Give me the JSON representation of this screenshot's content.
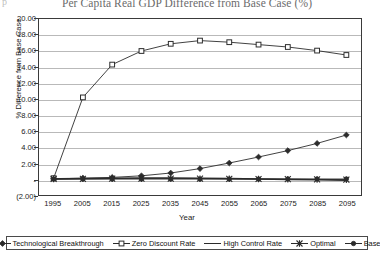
{
  "chart_data": {
    "type": "line",
    "title": "Per Capita Real GDP Difference from Base Case (%)",
    "xlabel": "Year",
    "ylabel": "% Difference from Base Case",
    "grid": true,
    "legend_position": "bottom",
    "ylim": [
      -2.0,
      20.0
    ],
    "ytick_step": 2.0,
    "ytick_labels": [
      "20.00",
      "18.00",
      "16.00",
      "14.00",
      "12.00",
      "10.00",
      "8.00",
      "6.00",
      "4.00",
      "2.00",
      "-",
      "(2.00)"
    ],
    "ytick_values": [
      20.0,
      18.0,
      16.0,
      14.0,
      12.0,
      10.0,
      8.0,
      6.0,
      4.0,
      2.0,
      0.0,
      -2.0
    ],
    "categories": [
      "1995",
      "2005",
      "2015",
      "2025",
      "2035",
      "2045",
      "2055",
      "2065",
      "2075",
      "2085",
      "2095"
    ],
    "x": [
      1995,
      2005,
      2015,
      2025,
      2035,
      2045,
      2055,
      2065,
      2075,
      2085,
      2095
    ],
    "series": [
      {
        "name": "Technological Breakthrough",
        "marker": "diamond",
        "color": "#2b2b2b",
        "values": [
          0.05,
          0.1,
          0.2,
          0.4,
          0.75,
          1.3,
          2.0,
          2.75,
          3.55,
          4.45,
          5.5
        ]
      },
      {
        "name": "Zero Discount Rate",
        "marker": "square",
        "color": "#2b2b2b",
        "values": [
          0.1,
          10.2,
          14.3,
          16.0,
          16.9,
          17.3,
          17.1,
          16.8,
          16.5,
          16.05,
          15.5
        ]
      },
      {
        "name": "High Control Rate",
        "marker": "none",
        "color": "#2b2b2b",
        "values": [
          0.0,
          0.05,
          0.1,
          0.12,
          0.12,
          0.1,
          0.05,
          0.0,
          -0.05,
          -0.1,
          -0.15
        ]
      },
      {
        "name": "Optimal",
        "marker": "asterisk",
        "color": "#2b2b2b",
        "values": [
          0.0,
          0.02,
          0.04,
          0.05,
          0.05,
          0.04,
          0.02,
          0.0,
          -0.02,
          -0.05,
          -0.08
        ]
      },
      {
        "name": "Base",
        "marker": "circle",
        "color": "#2b2b2b",
        "values": [
          0.0,
          0.0,
          0.0,
          0.0,
          0.0,
          0.0,
          0.0,
          0.0,
          0.0,
          0.0,
          0.0
        ]
      }
    ]
  },
  "title_left_mark": "p"
}
